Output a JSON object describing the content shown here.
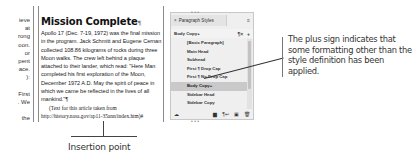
{
  "left_column": {
    "fragments": [
      "ieve",
      "at",
      "rong",
      "oon.",
      "or",
      "pent",
      "ace.",
      "):",
      "",
      "First",
      ". We",
      "",
      "the"
    ]
  },
  "article": {
    "headline": "Mission Complete",
    "headline_mark": "¶",
    "body": "Apollo 17 (Dec. 7-19, 1972) was the final mission in the program. Jack Schmitt and Eugene Cernan collected 108.86 kilograms of rocks during three Moon walks. The crew left behind a plaque attached to their lander, which read: \"Here Man completed his first exploration of the Moon, December 1972 A.D. May the spirit of peace in which we came be reflected in the lives of all mankind.\"¶",
    "source": "(Text for this article taken from http://history.nasa.gov/ap11-35ann/index.htm)#"
  },
  "insertion_point": {
    "label": "Insertion point"
  },
  "panel": {
    "title": "Paragraph Styles",
    "close_icon": "×",
    "menu_icon": "≡",
    "current_style": "Body Copy+",
    "clear_overrides_icon": "¶×",
    "new_style_icon": "+",
    "styles": [
      {
        "label": "[Basic Paragraph]",
        "selected": false
      },
      {
        "label": "Main Head",
        "selected": false
      },
      {
        "label": "Subhead",
        "selected": false
      },
      {
        "label": "First ¶ Drop Cap",
        "selected": false
      },
      {
        "label": "First ¶ No Drop Cap",
        "selected": false
      },
      {
        "label": "Body Copy+",
        "selected": true
      },
      {
        "label": "Sidebar Head",
        "selected": false
      },
      {
        "label": "Sidebar Copy",
        "selected": false
      }
    ],
    "footer": {
      "library_icon": "☁",
      "folder_icon": "▆",
      "style_override_icon": "¶↩",
      "new_icon": "▣",
      "delete_icon": "🗑"
    }
  },
  "callout": {
    "text": "The plus sign indicates that some formatting other than the style definition has been applied."
  }
}
